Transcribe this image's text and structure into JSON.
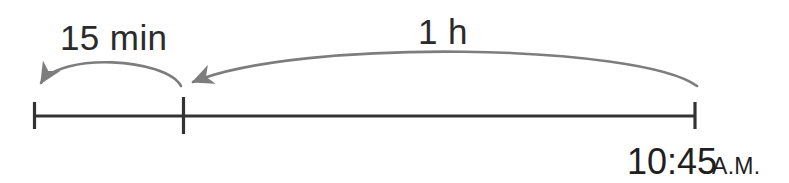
{
  "diagram": {
    "type": "number-line-timeline",
    "background_color": "#ffffff",
    "baseline_color": "#333333",
    "arc_color": "#7d7d7d",
    "text_color": "#2b2b2b",
    "jumps": [
      {
        "id": "jump-15-min",
        "label": "15 min",
        "direction": "left",
        "from_tick": "tick-middle",
        "to_tick": "tick-left"
      },
      {
        "id": "jump-1-h",
        "label": "1 h",
        "direction": "left",
        "from_tick": "tick-right",
        "to_tick": "tick-middle"
      }
    ],
    "ticks": [
      {
        "id": "tick-left",
        "label": ""
      },
      {
        "id": "tick-middle",
        "label": ""
      },
      {
        "id": "tick-right",
        "label": ""
      }
    ],
    "end_time": {
      "time": "10:45",
      "meridiem": "A.M."
    }
  }
}
